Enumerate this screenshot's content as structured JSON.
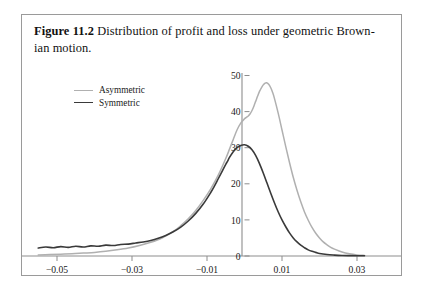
{
  "figure": {
    "caption_label": "Figure 11.2",
    "caption_text": "Distribution of profit and loss under geometric Brown-",
    "caption_text_line2": "ian motion."
  },
  "legend": {
    "position": "upper-left-inside",
    "items": [
      {
        "label": "Asymmetric",
        "color": "#b0b0b0"
      },
      {
        "label": "Symmetric",
        "color": "#3a3a3a"
      }
    ]
  },
  "chart_data": {
    "type": "line",
    "title": "",
    "xlabel": "",
    "ylabel": "",
    "xlim": [
      -0.058,
      0.0335
    ],
    "ylim": [
      0,
      52
    ],
    "grid": false,
    "xticks": [
      -0.05,
      -0.03,
      -0.01,
      0.01,
      0.03
    ],
    "xtick_labels": [
      "-0.05",
      "-0.03",
      "-0.01",
      "0.01",
      "0.03"
    ],
    "yticks": [
      0,
      10,
      20,
      30,
      40,
      50
    ],
    "ytick_labels": [
      "0",
      "10",
      "20",
      "30",
      "40",
      "50"
    ],
    "zero_axis_x": 0,
    "series": [
      {
        "name": "Asymmetric",
        "color": "#b0b0b0",
        "linewidth": 1.5,
        "peak_x": 0.0059,
        "peak_y": 48,
        "x": [
          -0.055,
          -0.052,
          -0.049,
          -0.046,
          -0.043,
          -0.04,
          -0.037,
          -0.034,
          -0.031,
          -0.028,
          -0.025,
          -0.022,
          -0.019,
          -0.017,
          -0.015,
          -0.013,
          -0.011,
          -0.009,
          -0.007,
          -0.005,
          -0.004,
          -0.003,
          -0.002,
          -0.001,
          0.0,
          0.0005,
          0.001,
          0.0015,
          0.002,
          0.0025,
          0.003,
          0.0035,
          0.004,
          0.0045,
          0.005,
          0.0055,
          0.0059,
          0.0065,
          0.007,
          0.0075,
          0.008,
          0.009,
          0.01,
          0.011,
          0.012,
          0.013,
          0.014,
          0.015,
          0.016,
          0.017,
          0.018,
          0.019,
          0.02,
          0.021,
          0.022,
          0.023,
          0.024,
          0.026,
          0.028,
          0.03,
          0.032
        ],
        "y": [
          0.3,
          0.4,
          0.5,
          0.6,
          0.8,
          1.0,
          1.3,
          1.7,
          2.2,
          2.9,
          3.8,
          5.0,
          6.8,
          8.4,
          10.3,
          12.6,
          15.4,
          18.6,
          22.4,
          27.0,
          29.6,
          32.3,
          34.9,
          36.8,
          38.0,
          38.4,
          38.8,
          39.4,
          40.3,
          41.5,
          42.9,
          44.3,
          45.6,
          46.6,
          47.4,
          47.9,
          48.0,
          47.5,
          46.6,
          45.3,
          43.6,
          39.5,
          34.9,
          30.3,
          25.9,
          21.8,
          18.2,
          15.0,
          12.2,
          9.9,
          7.9,
          6.3,
          5.0,
          3.9,
          3.1,
          2.4,
          1.9,
          1.1,
          0.6,
          0.3,
          0.15
        ]
      },
      {
        "name": "Symmetric",
        "color": "#3a3a3a",
        "linewidth": 1.6,
        "peak_x": -0.0045,
        "peak_y": 31,
        "x": [
          -0.055,
          -0.053,
          -0.051,
          -0.049,
          -0.047,
          -0.045,
          -0.043,
          -0.041,
          -0.039,
          -0.037,
          -0.035,
          -0.033,
          -0.031,
          -0.029,
          -0.027,
          -0.025,
          -0.023,
          -0.021,
          -0.019,
          -0.017,
          -0.015,
          -0.013,
          -0.011,
          -0.009,
          -0.008,
          -0.007,
          -0.006,
          -0.005,
          -0.0045,
          -0.004,
          -0.003,
          -0.002,
          -0.001,
          0.0,
          0.001,
          0.002,
          0.003,
          0.004,
          0.005,
          0.006,
          0.007,
          0.008,
          0.009,
          0.01,
          0.011,
          0.012,
          0.013,
          0.014,
          0.015,
          0.016,
          0.017,
          0.018,
          0.019,
          0.02,
          0.022,
          0.024,
          0.026,
          0.028,
          0.03,
          0.032
        ],
        "y": [
          2.2,
          2.5,
          2.3,
          2.6,
          2.4,
          2.7,
          2.5,
          2.8,
          2.7,
          3.0,
          2.9,
          3.2,
          3.3,
          3.6,
          3.9,
          4.3,
          4.9,
          5.7,
          6.7,
          8.0,
          9.7,
          11.8,
          14.4,
          17.6,
          19.4,
          21.4,
          23.4,
          25.4,
          26.3,
          27.3,
          28.9,
          30.0,
          30.6,
          30.8,
          30.4,
          29.4,
          27.8,
          25.6,
          23.0,
          20.2,
          17.4,
          14.7,
          12.2,
          10.0,
          8.1,
          6.4,
          5.0,
          3.9,
          3.0,
          2.3,
          1.7,
          1.3,
          1.0,
          0.7,
          0.4,
          0.25,
          0.15,
          0.1,
          0.07,
          0.05
        ]
      }
    ]
  }
}
